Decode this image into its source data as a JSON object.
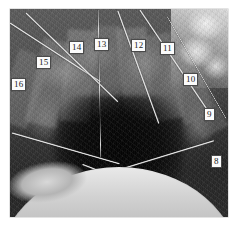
{
  "figure": {
    "kind": "photograph",
    "palette": "grayscale",
    "caption": "",
    "photo": {
      "alt": "Dark circular excavation pit surrounded by radially set stone slabs, survey rods converging toward the centre, bright rocky outcrop at upper right and bright curved rim at the bottom."
    },
    "labels": [
      {
        "id": "label-16",
        "text": "16",
        "x": 11,
        "y": 78
      },
      {
        "id": "label-15",
        "text": "15",
        "x": 36,
        "y": 56
      },
      {
        "id": "label-14",
        "text": "14",
        "x": 69,
        "y": 41
      },
      {
        "id": "label-13",
        "text": "13",
        "x": 94,
        "y": 38
      },
      {
        "id": "label-12",
        "text": "12",
        "x": 131,
        "y": 39
      },
      {
        "id": "label-11",
        "text": "11",
        "x": 160,
        "y": 42
      },
      {
        "id": "label-10",
        "text": "10",
        "x": 183,
        "y": 73
      },
      {
        "id": "label-9",
        "text": "9",
        "x": 204,
        "y": 108
      },
      {
        "id": "label-8",
        "text": "8",
        "x": 211,
        "y": 155
      }
    ],
    "rods": [
      {
        "id": "rod-1",
        "x": 10,
        "y": 22,
        "len": 108,
        "angle": 33,
        "w": 1.6
      },
      {
        "id": "rod-2",
        "x": 26,
        "y": 12,
        "len": 128,
        "angle": 44,
        "w": 1.6
      },
      {
        "id": "rod-3",
        "x": 98,
        "y": 9,
        "len": 148,
        "angle": 89,
        "w": 1.3
      },
      {
        "id": "rod-4",
        "x": 118,
        "y": 10,
        "len": 120,
        "angle": 70,
        "w": 1.5
      },
      {
        "id": "rod-5",
        "x": 140,
        "y": 9,
        "len": 126,
        "angle": 56,
        "w": 1.5
      },
      {
        "id": "rod-6",
        "x": 167,
        "y": 16,
        "len": 118,
        "angle": 60,
        "w": 1.4
      },
      {
        "id": "rod-7",
        "x": 12,
        "y": 132,
        "len": 112,
        "angle": 16,
        "w": 1.7
      },
      {
        "id": "rod-8",
        "x": 214,
        "y": 140,
        "len": 110,
        "angle": 163,
        "w": 1.7
      },
      {
        "id": "rod-9",
        "x": 131,
        "y": 182,
        "len": 52,
        "angle": 201,
        "w": 2.0
      }
    ],
    "slabs": [
      {
        "id": "slab-16",
        "x": 6,
        "y": 52,
        "w": 34,
        "h": 74,
        "angle": 20,
        "tone": "#7d7d7d"
      },
      {
        "id": "slab-15",
        "x": 34,
        "y": 40,
        "w": 32,
        "h": 86,
        "angle": 13,
        "tone": "#8a8a8a"
      },
      {
        "id": "slab-14",
        "x": 64,
        "y": 30,
        "w": 30,
        "h": 92,
        "angle": 5,
        "tone": "#949494"
      },
      {
        "id": "slab-13",
        "x": 93,
        "y": 26,
        "w": 28,
        "h": 90,
        "angle": 0,
        "tone": "#7f7f7f"
      },
      {
        "id": "slab-12",
        "x": 120,
        "y": 28,
        "w": 30,
        "h": 92,
        "angle": -5,
        "tone": "#8f8f8f"
      },
      {
        "id": "slab-11",
        "x": 148,
        "y": 34,
        "w": 30,
        "h": 86,
        "angle": -11,
        "tone": "#858585"
      },
      {
        "id": "slab-10",
        "x": 172,
        "y": 46,
        "w": 32,
        "h": 76,
        "angle": -18,
        "tone": "#7b7b7b"
      },
      {
        "id": "slab-9",
        "x": 186,
        "y": 74,
        "w": 30,
        "h": 62,
        "angle": -28,
        "tone": "#6f6f6f"
      }
    ]
  }
}
